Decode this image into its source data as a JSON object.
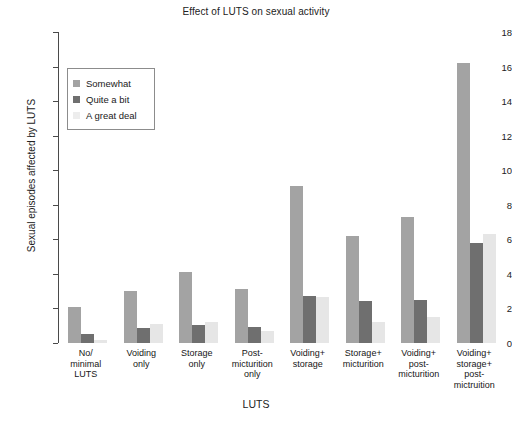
{
  "chart_data": {
    "type": "bar",
    "title": "Effect of LUTS on sexual activity",
    "xlabel": "LUTS",
    "ylabel": "Sexual episodes affected by LUTS",
    "ylim": [
      0,
      18
    ],
    "yticks": [
      0,
      2,
      4,
      6,
      8,
      10,
      12,
      14,
      16,
      18
    ],
    "grid": false,
    "legend_position": "upper left",
    "categories": [
      "No/\nminimal\nLUTS",
      "Voiding\nonly",
      "Storage\nonly",
      "Post-\nmicturition\nonly",
      "Voiding+\nstorage",
      "Storage+\nmicturition",
      "Voiding+\npost-\nmicturition",
      "Voiding+\nstorage+\npost-\nmictruition"
    ],
    "series": [
      {
        "name": "Somewhat",
        "color": "#a3a3a3",
        "values": [
          2.1,
          3.0,
          4.1,
          3.1,
          9.1,
          6.2,
          7.3,
          16.2
        ]
      },
      {
        "name": "Quite a bit",
        "color": "#6f6f6f",
        "values": [
          0.55,
          0.85,
          1.05,
          0.9,
          2.7,
          2.45,
          2.5,
          5.8
        ]
      },
      {
        "name": "A great deal",
        "color": "#e6e6e6",
        "values": [
          0.15,
          1.1,
          1.2,
          0.7,
          2.65,
          1.2,
          1.5,
          6.3
        ]
      }
    ]
  }
}
